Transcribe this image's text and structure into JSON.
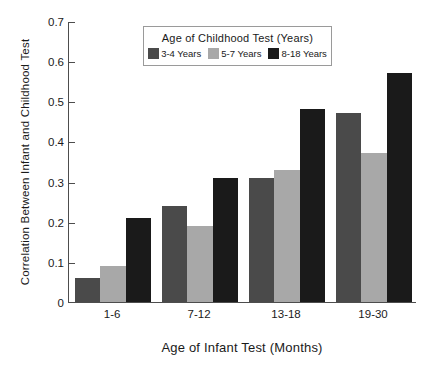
{
  "chart_data": {
    "type": "bar",
    "title": "",
    "xlabel": "Age of Infant Test (Months)",
    "ylabel": "Correlation Between Infant and Childhood Test",
    "categories": [
      "1-6",
      "7-12",
      "13-18",
      "19-30"
    ],
    "series": [
      {
        "name": "3-4 Years",
        "color": "#4a4a4a",
        "values": [
          0.06,
          0.24,
          0.31,
          0.47
        ]
      },
      {
        "name": "5-7 Years",
        "color": "#a8a8a8",
        "values": [
          0.09,
          0.19,
          0.33,
          0.37
        ]
      },
      {
        "name": "8-18 Years",
        "color": "#1a1a1a",
        "values": [
          0.21,
          0.31,
          0.48,
          0.57
        ]
      }
    ],
    "ylim": [
      0,
      0.7
    ],
    "ytick_values": [
      0,
      0.1,
      0.2,
      0.3,
      0.4,
      0.5,
      0.6,
      0.7
    ],
    "ytick_labels": [
      "0",
      "0.1",
      "0.2",
      "0.3",
      "0.4",
      "0.5",
      "0.6",
      "0.7"
    ],
    "grid": false,
    "legend_position": "inside-top-center",
    "legend_title": "Age of Childhood Test (Years)",
    "axis_color": "#4d4d4d"
  }
}
